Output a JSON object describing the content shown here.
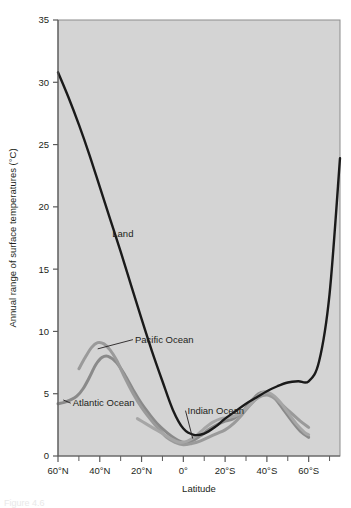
{
  "figure": {
    "caption_fragment": "Figure 4.6"
  },
  "chart_data": {
    "type": "line",
    "title": "",
    "xlabel": "Latitude",
    "ylabel": "Annual range of surface temperatures (°C)",
    "xlim": [
      60,
      -75
    ],
    "ylim": [
      0,
      35
    ],
    "grid": false,
    "plot_background": "#d4d4d4",
    "legend": "inline-annotations",
    "x_tick_labels": [
      "60°N",
      "40°N",
      "20°N",
      "0°",
      "20°S",
      "40°S",
      "60°S"
    ],
    "x_tick_values": [
      60,
      40,
      20,
      0,
      -20,
      -40,
      -60
    ],
    "x_minor_tick_values": [
      50,
      30,
      10,
      -10,
      -30,
      -50,
      -70
    ],
    "y_tick_labels": [
      "0",
      "5",
      "10",
      "15",
      "20",
      "25",
      "30",
      "35"
    ],
    "y_tick_values": [
      0,
      5,
      10,
      15,
      20,
      25,
      30,
      35
    ],
    "series": [
      {
        "name": "Land",
        "label": "Land",
        "color": "#1a1a1a",
        "width": 2.4,
        "x": [
          60,
          55,
          50,
          45,
          40,
          35,
          30,
          25,
          20,
          15,
          10,
          5,
          0,
          -5,
          -10,
          -15,
          -20,
          -25,
          -30,
          -35,
          -40,
          -45,
          -50,
          -55,
          -60,
          -65,
          -70,
          -75
        ],
        "y": [
          30.8,
          28.8,
          26.6,
          24.2,
          21.6,
          19.0,
          16.4,
          13.7,
          11.0,
          8.4,
          6.0,
          3.7,
          2.2,
          1.7,
          1.8,
          2.3,
          3.0,
          3.6,
          4.2,
          4.7,
          5.2,
          5.6,
          5.9,
          6.0,
          6.0,
          7.6,
          13.0,
          23.9
        ]
      },
      {
        "name": "Pacific Ocean",
        "label": "Pacific Ocean",
        "color": "#9a9a9a",
        "width": 3.0,
        "x": [
          50,
          47,
          44,
          41,
          38,
          35,
          32,
          28,
          24,
          20,
          16,
          12,
          8,
          4,
          0,
          -4,
          -8,
          -12,
          -16,
          -20,
          -24,
          -28,
          -32,
          -36,
          -40,
          -44,
          -48,
          -52,
          -56,
          -60
        ],
        "y": [
          7.0,
          7.9,
          8.7,
          9.1,
          9.0,
          8.5,
          7.7,
          6.3,
          5.0,
          3.9,
          3.0,
          2.2,
          1.5,
          1.1,
          0.9,
          1.0,
          1.2,
          1.5,
          1.8,
          2.1,
          2.6,
          3.3,
          4.1,
          4.7,
          4.9,
          4.6,
          4.0,
          3.4,
          2.8,
          2.3
        ]
      },
      {
        "name": "Atlantic Ocean",
        "label": "Atlantic Ocean",
        "color": "#8a8a8a",
        "width": 3.0,
        "x": [
          60,
          57,
          54,
          51,
          48,
          45,
          42,
          39,
          36,
          32,
          28,
          24,
          20,
          16,
          12,
          8,
          4,
          0,
          -4,
          -8,
          -12,
          -16,
          -20,
          -24,
          -28,
          -32,
          -36,
          -40,
          -44,
          -48,
          -52,
          -56,
          -60
        ],
        "y": [
          4.2,
          4.3,
          4.5,
          4.8,
          5.4,
          6.3,
          7.3,
          7.9,
          8.0,
          7.5,
          6.5,
          5.3,
          4.2,
          3.3,
          2.5,
          1.9,
          1.4,
          1.1,
          1.2,
          1.6,
          2.1,
          2.5,
          2.8,
          3.0,
          3.5,
          4.3,
          5.0,
          5.1,
          4.6,
          3.7,
          2.8,
          2.0,
          1.5
        ]
      },
      {
        "name": "Indian Ocean",
        "label": "Indian Ocean",
        "color": "#a6a6a6",
        "width": 3.0,
        "x": [
          22,
          18,
          14,
          10,
          6,
          2,
          -2,
          -6,
          -10,
          -14,
          -18,
          -22,
          -26,
          -30,
          -34,
          -38,
          -42,
          -46,
          -50,
          -54,
          -58,
          -60
        ],
        "y": [
          3.0,
          2.6,
          2.2,
          1.8,
          1.4,
          1.1,
          1.2,
          1.6,
          2.2,
          2.7,
          3.0,
          3.1,
          3.3,
          3.8,
          4.5,
          5.1,
          5.0,
          4.4,
          3.5,
          2.6,
          1.9,
          1.7
        ]
      }
    ],
    "annotations": [
      {
        "text": "Land",
        "x": 34,
        "y": 17.6,
        "leader": false
      },
      {
        "text": "Pacific Ocean",
        "x": 27,
        "y": 9.1,
        "leader": true
      },
      {
        "text": "Atlantic Ocean",
        "x": 52,
        "y": 4.0,
        "leader": true
      },
      {
        "text": "Indian Ocean",
        "x": -2,
        "y": 3.4,
        "leader": true
      }
    ]
  }
}
